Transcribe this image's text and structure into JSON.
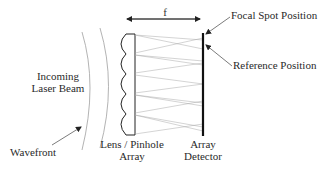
{
  "diagram": {
    "type": "shack-hartmann-wavefront-sensor-schematic",
    "labels": {
      "focal_length": "f",
      "focal_spot_position": "Focal Spot Position",
      "reference_position": "Reference Position",
      "incoming_laser_beam_line1": "Incoming",
      "incoming_laser_beam_line2": "Laser Beam",
      "wavefront": "Wavefront",
      "lens_array_line1": "Lens / Pinhole",
      "lens_array_line2": "Array",
      "detector_line1": "Array",
      "detector_line2": "Detector"
    },
    "components": {
      "lenslet_count": 5,
      "wavefront_arcs": 2
    },
    "colors": {
      "ink": "#222222",
      "ray": "#9a9a9a",
      "wavefront": "#a0a0a0",
      "background": "#ffffff"
    }
  }
}
